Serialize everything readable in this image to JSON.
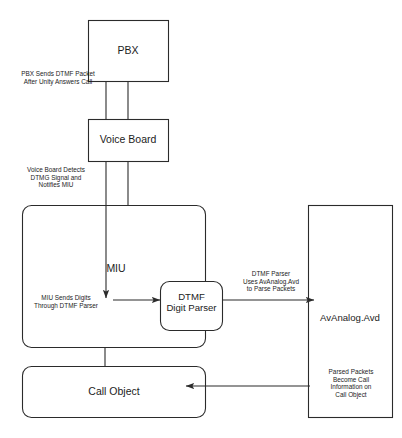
{
  "diagram": {
    "type": "flowchart",
    "stroke_color": "#2b2b2b",
    "fill_color": "#ffffff",
    "text_color": "#1c1c1c",
    "nodes": [
      {
        "id": "pbx",
        "label": "PBX",
        "shape": "rect"
      },
      {
        "id": "voice_board",
        "label": "Voice Board",
        "shape": "rect"
      },
      {
        "id": "miu",
        "label": "MIU",
        "shape": "rounded-rect"
      },
      {
        "id": "dtmf_parser",
        "label": "DTMF\nDigit Parser",
        "shape": "rounded-rect"
      },
      {
        "id": "call_object",
        "label": "Call Object",
        "shape": "rounded-rect"
      },
      {
        "id": "avanalog",
        "label": "AvAnalog.Avd",
        "shape": "rect"
      }
    ],
    "edges": [
      {
        "id": "pbx-to-voice-board",
        "from": "pbx",
        "to": "voice_board",
        "label": "PBX Sends DTMF Packet\nAfter Unity Answers Call"
      },
      {
        "id": "voice-board-to-miu",
        "from": "voice_board",
        "to": "miu",
        "label": "Voice Board Detects\nDTMG Signal and\nNotifies MIU"
      },
      {
        "id": "miu-to-dtmf-parser",
        "from": "miu",
        "to": "dtmf_parser",
        "label": "MIU Sends Digits\nThrough DTMF Parser"
      },
      {
        "id": "dtmf-parser-to-avanalog",
        "from": "dtmf_parser",
        "to": "avanalog",
        "label": "DTMF Parser\nUses AvAnalog.Avd\nto Parse Packets"
      },
      {
        "id": "avanalog-to-call-object",
        "from": "avanalog",
        "to": "call_object",
        "label": "Parsed Packets\nBecome Call\nInformation on\nCall Object"
      },
      {
        "id": "miu-to-call-object",
        "from": "miu",
        "to": "call_object",
        "label": ""
      }
    ]
  }
}
